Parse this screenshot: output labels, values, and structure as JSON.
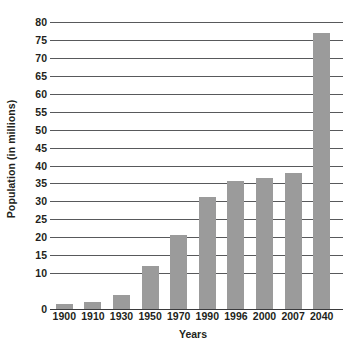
{
  "chart_data": {
    "type": "bar",
    "title": "",
    "xlabel": "Years",
    "ylabel": "Population (in millions)",
    "categories": [
      "1900",
      "1910",
      "1930",
      "1950",
      "1970",
      "1990",
      "1996",
      "2000",
      "2007",
      "2040"
    ],
    "values": [
      1.5,
      2.0,
      4.0,
      12.0,
      20.7,
      31.2,
      35.8,
      36.5,
      38.0,
      77.0
    ],
    "series": [
      {
        "name": "Population",
        "values": [
          1.5,
          2.0,
          4.0,
          12.0,
          20.7,
          31.2,
          35.8,
          36.5,
          38.0,
          77.0
        ]
      }
    ],
    "ylim": [
      0,
      80
    ],
    "xlim": [
      0,
      10
    ],
    "y_tick_values": [
      80,
      75,
      70,
      65,
      60,
      55,
      50,
      45,
      40,
      35,
      30,
      25,
      20,
      15,
      10,
      0
    ],
    "y_tick_labels": [
      "80",
      "75",
      "70",
      "65",
      "60",
      "55",
      "50",
      "45",
      "40",
      "35",
      "30",
      "25",
      "20",
      "15",
      "10",
      "0"
    ],
    "grid": true,
    "grid_axis": "y",
    "legend": false,
    "legend_position": "none",
    "bar_color": "#9b9b9b",
    "gridline_color": "#58595b",
    "axis_color": "#3b3b3d",
    "text_color": "#231f20",
    "background_color": "#ffffff"
  }
}
